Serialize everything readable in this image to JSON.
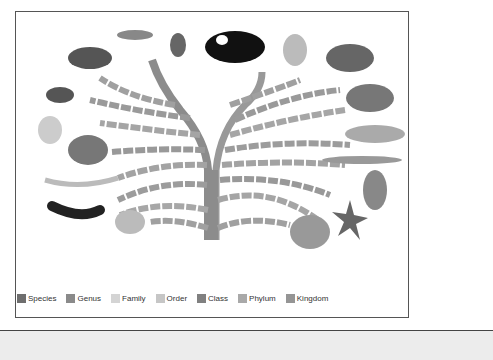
{
  "figure": {
    "animals_left": [
      "crab",
      "centipede",
      "spider",
      "sea fan / feather-duster worm",
      "snail",
      "segmented worm",
      "sea cucumber",
      "jellyfish"
    ],
    "animals_top": [
      "beetle",
      "cat",
      "bird"
    ],
    "animals_right": [
      "tortoise",
      "frog",
      "fish",
      "lancelet",
      "sponge-like blob",
      "starfish",
      "sponge / coral"
    ]
  },
  "legend": {
    "items": [
      {
        "label": "Species",
        "color": "#6e6e6e"
      },
      {
        "label": "Genus",
        "color": "#8a8a8a"
      },
      {
        "label": "Family",
        "color": "#d4d4d4"
      },
      {
        "label": "Order",
        "color": "#c6c6c6"
      },
      {
        "label": "Class",
        "color": "#808080"
      },
      {
        "label": "Phylum",
        "color": "#a9a9a9"
      },
      {
        "label": "Kingdom",
        "color": "#959595"
      }
    ]
  },
  "colors": {
    "trunk": "#8c8c8c",
    "frame_border": "#555555",
    "bottom_band": "#ececec"
  }
}
